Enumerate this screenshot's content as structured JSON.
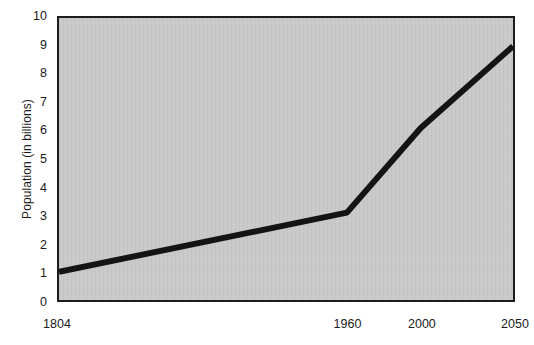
{
  "chart_data": {
    "type": "line",
    "title": "",
    "xlabel": "",
    "ylabel": "Population (in billions)",
    "grid": false,
    "legend": false,
    "xlim": [
      1804,
      2050
    ],
    "ylim": [
      0,
      10
    ],
    "x_tick_labels": [
      "1804",
      "1960",
      "2000",
      "2050"
    ],
    "x_tick_values": [
      1804,
      1960,
      2000,
      2050
    ],
    "y_tick_labels": [
      "0",
      "1",
      "2",
      "3",
      "4",
      "5",
      "6",
      "7",
      "8",
      "9",
      "10"
    ],
    "y_tick_values": [
      0,
      1,
      2,
      3,
      4,
      5,
      6,
      7,
      8,
      9,
      10
    ],
    "series": [
      {
        "name": "World population",
        "color": "#141414",
        "x": [
          1804,
          1960,
          2000,
          2050
        ],
        "values": [
          1.0,
          3.1,
          6.1,
          9.0
        ]
      }
    ]
  },
  "style": {
    "plot_background": "#c9c9c9",
    "frame_color": "#1c1c1c",
    "line_color": "#141414",
    "page_background": "#ffffff",
    "text_color": "#1a1a1a"
  }
}
